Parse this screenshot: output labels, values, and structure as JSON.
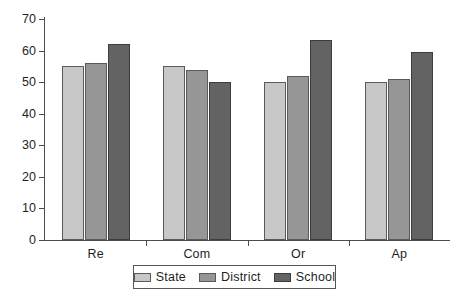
{
  "chart_data": {
    "type": "bar",
    "title": "",
    "xlabel": "",
    "ylabel": "",
    "categories": [
      "Re",
      "Com",
      "Or",
      "Ap"
    ],
    "series": [
      {
        "name": "State",
        "color": "#c8c8c8",
        "values": [
          55,
          55,
          50,
          50
        ]
      },
      {
        "name": "District",
        "color": "#969696",
        "values": [
          56,
          54,
          52,
          51
        ]
      },
      {
        "name": "School",
        "color": "#636363",
        "values": [
          62,
          50,
          63.5,
          59.5
        ]
      }
    ],
    "ylim": [
      0,
      70
    ],
    "ytick_labels": [
      "0",
      "10",
      "20",
      "30",
      "40",
      "50",
      "60",
      "70"
    ],
    "ytick_values": [
      0,
      10,
      20,
      30,
      40,
      50,
      60,
      70
    ],
    "grid": false,
    "legend_position": "bottom",
    "legend_entries": [
      "State",
      "District",
      "School"
    ]
  },
  "legend": {
    "items": [
      {
        "label": "State",
        "swatch": "legend-swatch-state"
      },
      {
        "label": "District",
        "swatch": "legend-swatch-district"
      },
      {
        "label": "School",
        "swatch": "legend-swatch-school"
      }
    ]
  }
}
